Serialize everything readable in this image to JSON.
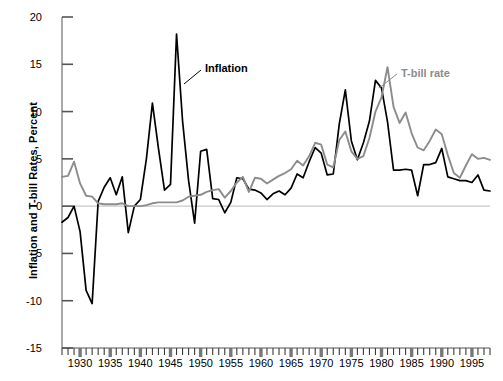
{
  "chart": {
    "title": "",
    "ylabel": "Inflation and T-bill Rates, Percent",
    "xlabel": "",
    "annotation_inflation": "Inflation",
    "annotation_tbill": "T-bill rate",
    "color_inflation": "#000000",
    "color_tbill": "#8c8c8c",
    "color_axis": "#000000",
    "color_zeroline": "#c8c8c8"
  },
  "chart_data": {
    "type": "line",
    "title": "",
    "xlabel": "",
    "ylabel": "Inflation and T-bill Rates, Percent",
    "xlim": [
      1927,
      1998
    ],
    "ylim": [
      -15,
      20
    ],
    "yticks": [
      20,
      15,
      10,
      5,
      0,
      -5,
      -10,
      -15
    ],
    "ytick_labels": [
      "20",
      "15",
      "10",
      "5",
      "0",
      "-5",
      "-10",
      "-15"
    ],
    "xticks": [
      1930,
      1935,
      1940,
      1945,
      1950,
      1955,
      1960,
      1965,
      1970,
      1975,
      1980,
      1985,
      1990,
      1995
    ],
    "xtick_labels": [
      "1930",
      "1935",
      "1940",
      "1945",
      "1950",
      "1955",
      "1960",
      "1965",
      "1970",
      "1975",
      "1980",
      "1985",
      "1990",
      "1995"
    ],
    "minor_xticks_every": 1,
    "grid": false,
    "legend_position": "inline-annotation",
    "zero_line": 0,
    "x": [
      1927,
      1928,
      1929,
      1930,
      1931,
      1932,
      1933,
      1934,
      1935,
      1936,
      1937,
      1938,
      1939,
      1940,
      1941,
      1942,
      1943,
      1944,
      1945,
      1946,
      1947,
      1948,
      1949,
      1950,
      1951,
      1952,
      1953,
      1954,
      1955,
      1956,
      1957,
      1958,
      1959,
      1960,
      1961,
      1962,
      1963,
      1964,
      1965,
      1966,
      1967,
      1968,
      1969,
      1970,
      1971,
      1972,
      1973,
      1974,
      1975,
      1976,
      1977,
      1978,
      1979,
      1980,
      1981,
      1982,
      1983,
      1984,
      1985,
      1986,
      1987,
      1988,
      1989,
      1990,
      1991,
      1992,
      1993,
      1994,
      1995,
      1996,
      1997,
      1998
    ],
    "series": [
      {
        "name": "Inflation",
        "color": "#000000",
        "values": [
          -1.7,
          -1.2,
          0.0,
          -2.7,
          -8.9,
          -10.3,
          0.5,
          2.0,
          3.0,
          1.2,
          3.1,
          -2.8,
          0.0,
          0.7,
          5.0,
          10.9,
          6.1,
          1.7,
          2.3,
          18.2,
          9.0,
          2.7,
          -1.8,
          5.8,
          6.0,
          0.8,
          0.7,
          -0.7,
          0.4,
          3.0,
          2.9,
          1.8,
          1.7,
          1.4,
          0.7,
          1.3,
          1.6,
          1.2,
          1.9,
          3.4,
          3.0,
          4.7,
          6.2,
          5.6,
          3.3,
          3.4,
          8.7,
          12.3,
          6.9,
          4.9,
          6.7,
          9.0,
          13.3,
          12.5,
          8.9,
          3.8,
          3.8,
          3.9,
          3.8,
          1.1,
          4.4,
          4.4,
          4.6,
          6.1,
          3.1,
          2.9,
          2.7,
          2.7,
          2.5,
          3.3,
          1.7,
          1.6
        ]
      },
      {
        "name": "T-bill rate",
        "color": "#8c8c8c",
        "values": [
          3.1,
          3.2,
          4.7,
          2.4,
          1.1,
          1.0,
          0.3,
          0.2,
          0.2,
          0.2,
          0.3,
          0.0,
          0.0,
          0.0,
          0.1,
          0.3,
          0.4,
          0.4,
          0.4,
          0.4,
          0.6,
          1.0,
          1.1,
          1.2,
          1.5,
          1.7,
          1.8,
          0.9,
          1.6,
          2.5,
          3.1,
          1.5,
          3.0,
          2.9,
          2.4,
          2.8,
          3.2,
          3.5,
          3.9,
          4.8,
          4.3,
          5.3,
          6.7,
          6.5,
          4.4,
          4.1,
          7.0,
          7.9,
          5.8,
          5.0,
          5.3,
          7.2,
          10.0,
          11.5,
          14.7,
          10.5,
          8.8,
          9.9,
          7.7,
          6.2,
          5.9,
          6.9,
          8.1,
          7.6,
          5.4,
          3.5,
          3.0,
          4.3,
          5.5,
          5.0,
          5.1,
          4.9
        ]
      }
    ]
  }
}
